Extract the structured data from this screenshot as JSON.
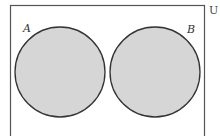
{
  "diagram": {
    "type": "venn",
    "universe_label": "U",
    "sets": [
      {
        "label": "A",
        "shaded": true
      },
      {
        "label": "B",
        "shaded": true
      }
    ],
    "relationship": "disjoint",
    "colors": {
      "fill": "#d6d6d6",
      "stroke": "#333333",
      "border": "#555555",
      "background": "#ffffff"
    }
  }
}
